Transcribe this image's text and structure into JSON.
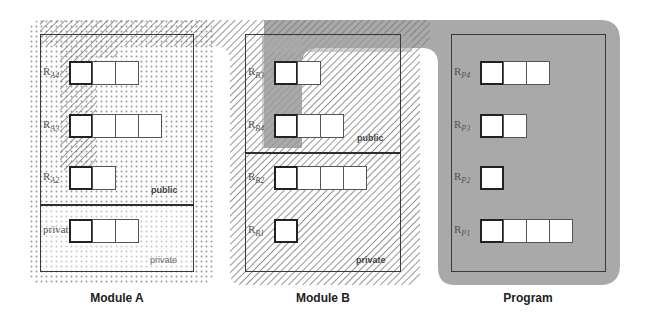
{
  "diagram": {
    "modules": [
      {
        "id": "A",
        "caption": "Module A",
        "sections": [
          {
            "name": "public",
            "label": "public",
            "registers": [
              {
                "label": "R",
                "sub": "A4",
                "cells": 3
              },
              {
                "label": "R",
                "sub": "A3",
                "cells": 4
              },
              {
                "label": "R",
                "sub": "A2",
                "cells": 2
              }
            ]
          },
          {
            "name": "private",
            "label": "private",
            "registers": [
              {
                "label": "R",
                "sub": "A1",
                "cells": 3
              }
            ]
          }
        ]
      },
      {
        "id": "B",
        "caption": "Module B",
        "sections": [
          {
            "name": "public",
            "label": "public",
            "registers": [
              {
                "label": "R",
                "sub": "B3",
                "cells": 2
              },
              {
                "label": "R",
                "sub": "B4",
                "cells": 3
              }
            ]
          },
          {
            "name": "private",
            "label": "private",
            "registers": [
              {
                "label": "R",
                "sub": "B2",
                "cells": 4
              },
              {
                "label": "R",
                "sub": "B1",
                "cells": 1
              }
            ]
          }
        ]
      },
      {
        "id": "P",
        "caption": "Program",
        "sections": [
          {
            "name": "program",
            "label": "",
            "registers": [
              {
                "label": "R",
                "sub": "P4",
                "cells": 3
              },
              {
                "label": "R",
                "sub": "P3",
                "cells": 2
              },
              {
                "label": "R",
                "sub": "P2",
                "cells": 1
              },
              {
                "label": "R",
                "sub": "P1",
                "cells": 4
              }
            ]
          }
        ]
      }
    ],
    "regions": [
      {
        "name": "dotted-region",
        "pattern": "dots",
        "covers": "Module A"
      },
      {
        "name": "hatched-region",
        "pattern": "diagonal-hatch",
        "covers": "Module A top + Module B"
      },
      {
        "name": "gray-region",
        "pattern": "solid-gray",
        "covers": "Program + Module B public (R_B3, R_B4 first cells)"
      }
    ],
    "colors": {
      "gray_region": "#a9a9a9",
      "border": "#3a3a3a",
      "dots": "#9a9a9a",
      "hatch": "#7a7a7a"
    }
  }
}
